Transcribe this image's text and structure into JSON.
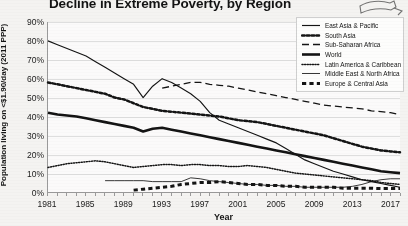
{
  "chart_data": {
    "type": "line",
    "title": "Decline in Extreme Poverty, by Region",
    "xlabel": "Year",
    "ylabel": "Population living on <$1.90/day (2011 PPP)",
    "ylim": [
      0,
      90
    ],
    "xlim": [
      1981,
      2018
    ],
    "grid": true,
    "legend_position": "top-right",
    "y_ticks": [
      "0%",
      "10%",
      "20%",
      "30%",
      "40%",
      "50%",
      "60%",
      "70%",
      "80%",
      "90%"
    ],
    "y_tick_values": [
      0,
      10,
      20,
      30,
      40,
      50,
      60,
      70,
      80,
      90
    ],
    "x_ticks": [
      "1981",
      "1985",
      "1989",
      "1993",
      "1997",
      "2001",
      "2005",
      "2009",
      "2013",
      "2017"
    ],
    "x_tick_values": [
      1981,
      1985,
      1989,
      1993,
      1997,
      2001,
      2005,
      2009,
      2013,
      2017
    ],
    "x": [
      1981,
      1982,
      1983,
      1984,
      1985,
      1986,
      1987,
      1988,
      1989,
      1990,
      1991,
      1992,
      1993,
      1994,
      1995,
      1996,
      1997,
      1998,
      1999,
      2000,
      2001,
      2002,
      2003,
      2004,
      2005,
      2006,
      2007,
      2008,
      2009,
      2010,
      2011,
      2012,
      2013,
      2014,
      2015,
      2016,
      2017,
      2018
    ],
    "series": [
      {
        "name": "East Asia & Pacific",
        "style": "solid-thin",
        "values": [
          80,
          78,
          76,
          74,
          72,
          69,
          66,
          63,
          60,
          57,
          50,
          56,
          60,
          58,
          55,
          52,
          48,
          42,
          38,
          36,
          34,
          32,
          30,
          28,
          26,
          23,
          20,
          17,
          15,
          13,
          11,
          9.5,
          8,
          6.5,
          5.5,
          4.5,
          3.5,
          2.5
        ]
      },
      {
        "name": "South Asia",
        "style": "dotted-heavy",
        "values": [
          58,
          57,
          56,
          55,
          54,
          53,
          52,
          50,
          49,
          47,
          45,
          44,
          43,
          42.5,
          42,
          41.5,
          41,
          40.5,
          40,
          39,
          38,
          37.5,
          37,
          36,
          35,
          34,
          33,
          32,
          31,
          30,
          28.5,
          27,
          25.5,
          24,
          23,
          22,
          21.5,
          21
        ]
      },
      {
        "name": "Sub-Saharan Africa",
        "style": "dashed-long",
        "values": [
          null,
          null,
          null,
          null,
          null,
          null,
          null,
          null,
          null,
          null,
          null,
          null,
          55,
          56,
          57,
          58,
          58,
          57,
          56.5,
          56,
          55,
          54,
          53,
          52,
          51,
          50,
          49,
          48,
          47,
          46,
          45.5,
          45,
          44.5,
          44,
          43,
          42.5,
          42,
          41
        ]
      },
      {
        "name": "World",
        "style": "solid-thick",
        "values": [
          42,
          41,
          40.5,
          40,
          39,
          38,
          37,
          36,
          35,
          34,
          32,
          33.5,
          34,
          33,
          32,
          31,
          30,
          29,
          28,
          27,
          26,
          25,
          24,
          23,
          22,
          21,
          20,
          19,
          18,
          17,
          16,
          15,
          14,
          13,
          12,
          11,
          10.5,
          10
        ]
      },
      {
        "name": "Latin America & Caribbean",
        "style": "dotted-fine",
        "values": [
          13,
          14,
          15,
          15.5,
          16,
          16.5,
          16,
          15,
          14,
          13,
          13.5,
          14,
          14.5,
          14.5,
          14,
          14.5,
          14.5,
          14,
          14,
          13.5,
          13.5,
          14,
          13.5,
          13,
          12,
          11,
          10,
          9.5,
          9,
          8.5,
          8,
          7.5,
          7,
          6.5,
          6,
          5,
          4.5,
          4
        ]
      },
      {
        "name": "Middle East & North Africa",
        "style": "solid-hairline",
        "values": [
          null,
          null,
          null,
          null,
          null,
          null,
          6,
          6,
          6,
          6,
          6,
          5.5,
          5.5,
          5.5,
          5.5,
          7.5,
          7,
          6,
          5.5,
          5,
          4.5,
          4,
          4,
          3.5,
          3.5,
          3,
          3,
          2.5,
          2.5,
          2.5,
          2.5,
          2.5,
          3,
          4,
          5.5,
          6.5,
          7,
          7
        ]
      },
      {
        "name": "Europe & Central Asia",
        "style": "dashed-thick",
        "values": [
          null,
          null,
          null,
          null,
          null,
          null,
          null,
          null,
          null,
          1,
          1.5,
          2,
          2.5,
          3,
          4,
          4.5,
          5,
          5,
          5.5,
          5,
          4.5,
          4,
          4,
          3.5,
          3.5,
          3,
          3,
          2.5,
          2.5,
          2.5,
          2.5,
          2,
          2,
          2,
          2,
          1.8,
          1.8,
          1.8
        ]
      }
    ]
  },
  "legend": {
    "items": [
      {
        "label": "East Asia & Pacific",
        "style": "solid-thin"
      },
      {
        "label": "South Asia",
        "style": "dotted-heavy"
      },
      {
        "label": "Sub-Saharan Africa",
        "style": "dashed-long"
      },
      {
        "label": "World",
        "style": "solid-thick"
      },
      {
        "label": "Latin America & Caribbean",
        "style": "dotted-fine"
      },
      {
        "label": "Middle East & North Africa",
        "style": "solid-hairline"
      },
      {
        "label": "Europe & Central Asia",
        "style": "dashed-thick"
      }
    ]
  },
  "corner_logo": {
    "icon": "hand-pointer-icon"
  },
  "colors": {
    "ink": "#141414",
    "grid": "#dedede",
    "axis": "#9a9a9a",
    "background": "#f4f3f1",
    "plot_background": "#fbfafa"
  }
}
